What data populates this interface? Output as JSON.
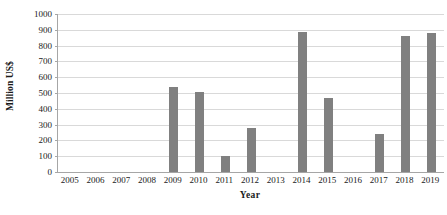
{
  "chart_data": {
    "type": "bar",
    "title": "",
    "subtitle": "",
    "xlabel": "Year",
    "ylabel": "Million US$",
    "categories": [
      "2005",
      "2006",
      "2007",
      "2008",
      "2009",
      "2010",
      "2011",
      "2012",
      "2013",
      "2014",
      "2015",
      "2016",
      "2017",
      "2018",
      "2019"
    ],
    "values": [
      0,
      0,
      0,
      0,
      535,
      505,
      100,
      278,
      0,
      886,
      468,
      0,
      240,
      860,
      880
    ],
    "ylim": [
      0,
      1000
    ],
    "ytick_values": [
      0,
      100,
      200,
      300,
      400,
      500,
      600,
      700,
      800,
      900,
      1000
    ],
    "ytick_labels": [
      "0",
      "100",
      "200",
      "300",
      "400",
      "500",
      "600",
      "700",
      "800",
      "900",
      "1000"
    ],
    "grid": true,
    "grid_axis": "y",
    "legend": false,
    "legend_position": "none",
    "bar_color": "#808080",
    "gridline_color": "#D9D9D9",
    "axis_color": "#A6A6A6",
    "text_color": "#1A1A1A",
    "annotations": []
  }
}
